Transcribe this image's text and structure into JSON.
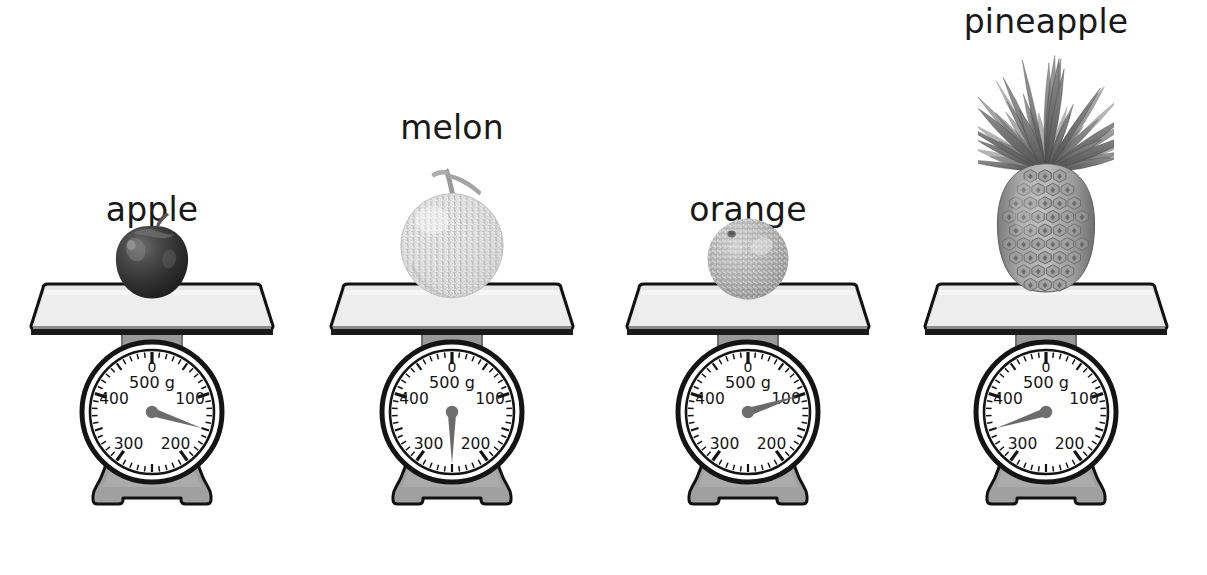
{
  "page": {
    "background_color": "#ffffff",
    "width": 1207,
    "height": 575
  },
  "dial": {
    "zero_label": "0",
    "unit_label": "500 g",
    "tick_labels": [
      "100",
      "200",
      "300",
      "400"
    ],
    "face_color": "#ffffff",
    "ring_color": "#141414",
    "needle_color": "#6b6b6b",
    "body_color": "#9a9a9a",
    "platform_color": "#e3e3e3",
    "min": 0,
    "max": 500
  },
  "scales": [
    {
      "id": "apple-scale",
      "label": "apple",
      "fruit": "apple",
      "reading_g": 150,
      "needle_angle_deg": 108,
      "label_top": 190,
      "center_x": 152,
      "fruit_color": "#3a3a3a"
    },
    {
      "id": "melon-scale",
      "label": "melon",
      "fruit": "melon",
      "reading_g": 250,
      "needle_angle_deg": 180,
      "label_top": 108,
      "center_x": 452,
      "fruit_color": "#dcdcdc"
    },
    {
      "id": "orange-scale",
      "label": "orange",
      "fruit": "orange",
      "reading_g": 100,
      "needle_angle_deg": 72,
      "label_top": 190,
      "center_x": 748,
      "fruit_color": "#a8a8a8"
    },
    {
      "id": "pineapple-scale",
      "label": "pineapple",
      "fruit": "pineapple",
      "reading_g": 350,
      "needle_angle_deg": 252,
      "label_top": 2,
      "center_x": 1046,
      "fruit_color": "#8f8f8f"
    }
  ]
}
